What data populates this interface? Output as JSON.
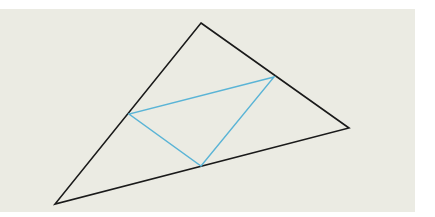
{
  "diagram": {
    "type": "geometry",
    "colors": {
      "background_panel": "#ebebe3",
      "page": "#ffffff",
      "outer_triangle": "#1a1a1a",
      "inner_triangle": "#5ab4d6"
    },
    "outer_triangle": {
      "vertices": [
        {
          "name": "top",
          "x": 201,
          "y": 23
        },
        {
          "name": "right",
          "x": 349,
          "y": 128
        },
        {
          "name": "bottom-left",
          "x": 55,
          "y": 204
        }
      ],
      "stroke_width": 1.6
    },
    "inner_triangle": {
      "vertices": [
        {
          "name": "on-right-side",
          "x": 274,
          "y": 77
        },
        {
          "name": "on-left-side",
          "x": 129,
          "y": 114
        },
        {
          "name": "on-bottom-side",
          "x": 201,
          "y": 166
        }
      ],
      "stroke_width": 1.4
    }
  }
}
